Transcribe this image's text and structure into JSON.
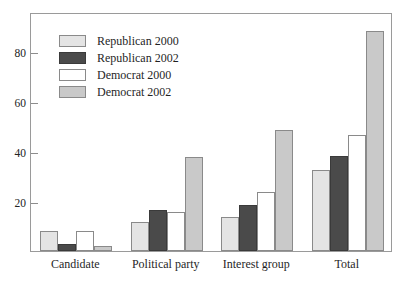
{
  "chart_data": {
    "type": "bar",
    "title": "",
    "subtitle": "",
    "xlabel": "",
    "ylabel": "",
    "categories": [
      "Candidate",
      "Political party",
      "Interest group",
      "Total"
    ],
    "series": [
      {
        "name": "Republican 2000",
        "color": "#e4e4e4",
        "values": [
          8,
          11.5,
          13.5,
          32.5
        ]
      },
      {
        "name": "Republican 2002",
        "color": "#4a4a4a",
        "values": [
          3,
          16.5,
          18.5,
          38
        ]
      },
      {
        "name": "Democrat 2000",
        "color": "#ffffff",
        "values": [
          8,
          15.5,
          23.5,
          46.5
        ]
      },
      {
        "name": "Democrat 2002",
        "color": "#c9c9c9",
        "values": [
          2,
          37.5,
          48.5,
          88
        ]
      }
    ],
    "yticks": [
      20,
      40,
      60,
      80
    ],
    "ylim": [
      0,
      95.5
    ],
    "grid": false,
    "legend_position": "upper-left-inside",
    "frame": true
  },
  "legend": {
    "items": [
      {
        "label": "Republican 2000"
      },
      {
        "label": "Republican 2002"
      },
      {
        "label": "Democrat 2000"
      },
      {
        "label": "Democrat 2002"
      }
    ]
  },
  "axis": {
    "y_tick_labels": [
      "80",
      "60",
      "40",
      "20"
    ]
  }
}
